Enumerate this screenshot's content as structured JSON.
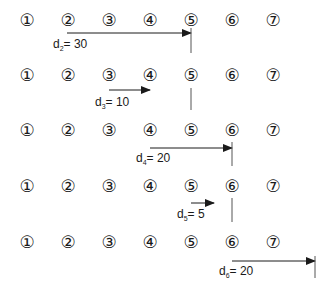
{
  "diagram": {
    "node_labels": [
      "①",
      "②",
      "③",
      "④",
      "⑤",
      "⑥",
      "⑦"
    ],
    "node_x": [
      27,
      68,
      109,
      150,
      191,
      232,
      273
    ],
    "rows": [
      {
        "y": 21,
        "arrow": {
          "from_x": 67,
          "to_x": 191,
          "y": 33
        },
        "marker": {
          "x": 191,
          "y1": 28,
          "y2": 53
        },
        "label": {
          "var": "d",
          "sub": "2",
          "rest": "= 30",
          "x": 53,
          "y": 38
        }
      },
      {
        "y": 76,
        "arrow": {
          "from_x": 109,
          "to_x": 150,
          "y": 90
        },
        "marker": {
          "x": 191,
          "y1": 88,
          "y2": 110
        },
        "label": {
          "var": "d",
          "sub": "3",
          "rest": "= 10",
          "x": 95,
          "y": 96
        }
      },
      {
        "y": 131,
        "arrow": {
          "from_x": 150,
          "to_x": 232,
          "y": 148
        },
        "marker": {
          "x": 232,
          "y1": 142,
          "y2": 166
        },
        "label": {
          "var": "d",
          "sub": "4",
          "rest": "= 20",
          "x": 136,
          "y": 152
        }
      },
      {
        "y": 187,
        "arrow": {
          "from_x": 191,
          "to_x": 214,
          "y": 203
        },
        "marker": {
          "x": 232,
          "y1": 198,
          "y2": 222
        },
        "label": {
          "var": "d",
          "sub": "5",
          "rest": "= 5",
          "x": 177,
          "y": 208
        }
      },
      {
        "y": 243,
        "arrow": {
          "from_x": 232,
          "to_x": 315,
          "y": 261
        },
        "marker": {
          "x": 315,
          "y1": 256,
          "y2": 278
        },
        "label": {
          "var": "d",
          "sub": "6",
          "rest": "= 20",
          "x": 219,
          "y": 265
        }
      }
    ],
    "colors": {
      "stroke": "#1a1a1a",
      "marker": "#555555"
    }
  }
}
